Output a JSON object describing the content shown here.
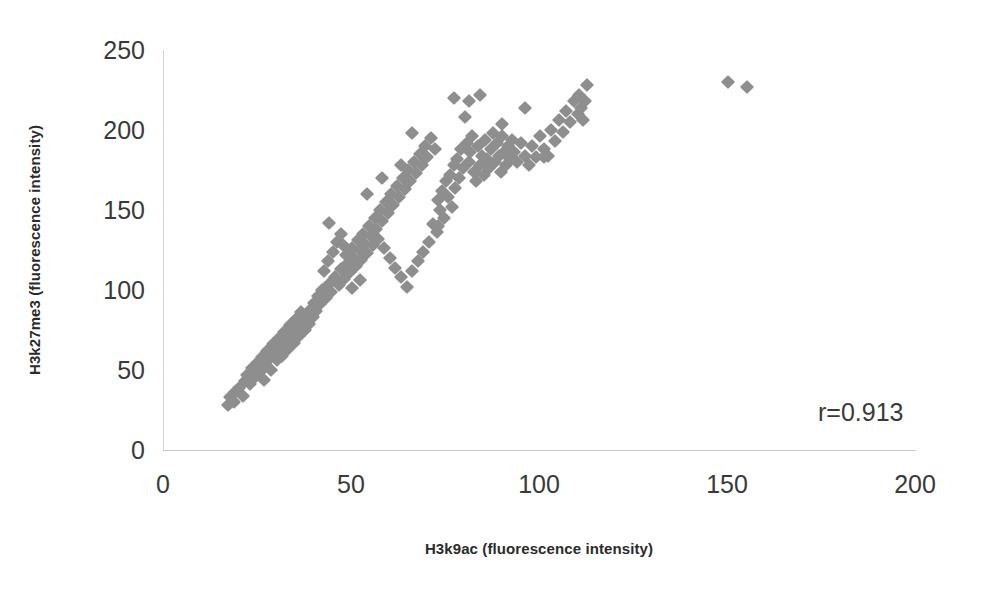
{
  "chart_data": {
    "type": "scatter",
    "title": "",
    "xlabel": "H3k9ac (fluorescence intensity)",
    "ylabel": "H3k27me3 (fluorescence intensity)",
    "xlim": [
      0,
      200
    ],
    "ylim": [
      0,
      250
    ],
    "xticks": [
      0,
      50,
      100,
      150,
      200
    ],
    "yticks": [
      0,
      50,
      100,
      150,
      200,
      250
    ],
    "grid": false,
    "legend": null,
    "marker": {
      "shape": "diamond",
      "color": "#8e8e8e",
      "size_px": 10
    },
    "annotations": [
      {
        "text": "r=0.913",
        "x": 172,
        "y": 32
      }
    ],
    "series": [
      {
        "name": "samples",
        "points": [
          [
            17,
            28
          ],
          [
            17.5,
            33
          ],
          [
            18.5,
            30
          ],
          [
            19,
            36
          ],
          [
            20,
            39
          ],
          [
            21,
            34
          ],
          [
            21.5,
            43
          ],
          [
            22,
            47
          ],
          [
            23,
            41
          ],
          [
            23.5,
            51
          ],
          [
            24,
            45
          ],
          [
            25,
            55
          ],
          [
            25.5,
            49
          ],
          [
            26,
            58
          ],
          [
            26.5,
            44
          ],
          [
            27,
            53
          ],
          [
            27.5,
            62
          ],
          [
            28,
            57
          ],
          [
            28.5,
            50
          ],
          [
            29,
            66
          ],
          [
            29.5,
            60
          ],
          [
            30,
            56
          ],
          [
            30.5,
            70
          ],
          [
            31,
            64
          ],
          [
            31.5,
            59
          ],
          [
            32,
            74
          ],
          [
            32.5,
            68
          ],
          [
            33,
            63
          ],
          [
            33.5,
            78
          ],
          [
            34,
            72
          ],
          [
            34.5,
            67
          ],
          [
            35,
            82
          ],
          [
            35.5,
            76
          ],
          [
            36,
            71
          ],
          [
            36.5,
            86
          ],
          [
            37,
            80
          ],
          [
            37.5,
            75
          ],
          [
            38,
            84
          ],
          [
            38.5,
            79
          ],
          [
            39,
            88
          ],
          [
            39.5,
            83
          ],
          [
            40,
            92
          ],
          [
            40.5,
            87
          ],
          [
            41,
            96
          ],
          [
            41.5,
            91
          ],
          [
            42,
            100
          ],
          [
            42.5,
            112
          ],
          [
            43,
            95
          ],
          [
            43.5,
            118
          ],
          [
            44,
            104
          ],
          [
            44.5,
            99
          ],
          [
            45,
            124
          ],
          [
            45.5,
            108
          ],
          [
            46,
            130
          ],
          [
            46.5,
            103
          ],
          [
            47,
            113
          ],
          [
            47.5,
            128
          ],
          [
            48,
            107
          ],
          [
            48.5,
            122
          ],
          [
            49,
            117
          ],
          [
            49.5,
            111
          ],
          [
            50,
            126
          ],
          [
            50.5,
            120
          ],
          [
            51,
            115
          ],
          [
            51.5,
            131
          ],
          [
            52,
            125
          ],
          [
            52.5,
            119
          ],
          [
            53,
            135
          ],
          [
            53.5,
            129
          ],
          [
            54,
            123
          ],
          [
            54.5,
            140
          ],
          [
            55,
            134
          ],
          [
            55.5,
            128
          ],
          [
            56,
            145
          ],
          [
            56.5,
            138
          ],
          [
            57,
            132
          ],
          [
            57.5,
            150
          ],
          [
            58,
            143
          ],
          [
            58.5,
            126
          ],
          [
            59,
            155
          ],
          [
            59.5,
            148
          ],
          [
            60,
            120
          ],
          [
            60.5,
            160
          ],
          [
            61,
            153
          ],
          [
            61.5,
            114
          ],
          [
            62,
            165
          ],
          [
            62.5,
            158
          ],
          [
            63,
            108
          ],
          [
            63.5,
            170
          ],
          [
            64,
            163
          ],
          [
            64.5,
            102
          ],
          [
            65,
            175
          ],
          [
            65.5,
            168
          ],
          [
            66,
            112
          ],
          [
            66.5,
            180
          ],
          [
            67,
            173
          ],
          [
            67.5,
            118
          ],
          [
            68,
            185
          ],
          [
            68.5,
            178
          ],
          [
            69,
            124
          ],
          [
            69.5,
            190
          ],
          [
            70,
            183
          ],
          [
            70.5,
            130
          ],
          [
            71,
            195
          ],
          [
            71.5,
            141
          ],
          [
            72,
            188
          ],
          [
            72.5,
            136
          ],
          [
            73,
            156
          ],
          [
            73.5,
            150
          ],
          [
            74,
            162
          ],
          [
            74.5,
            145
          ],
          [
            75,
            168
          ],
          [
            75.5,
            158
          ],
          [
            76,
            172
          ],
          [
            76.5,
            152
          ],
          [
            77,
            178
          ],
          [
            77.5,
            164
          ],
          [
            78,
            182
          ],
          [
            78.5,
            170
          ],
          [
            79,
            188
          ],
          [
            79.5,
            176
          ],
          [
            80,
            208
          ],
          [
            80.5,
            192
          ],
          [
            81,
            180
          ],
          [
            81.5,
            186
          ],
          [
            82,
            196
          ],
          [
            82.5,
            174
          ],
          [
            83,
            168
          ],
          [
            83.5,
            190
          ],
          [
            84,
            178
          ],
          [
            84.5,
            184
          ],
          [
            85,
            172
          ],
          [
            85.5,
            194
          ],
          [
            86,
            182
          ],
          [
            86.5,
            176
          ],
          [
            87,
            188
          ],
          [
            87.5,
            198
          ],
          [
            88,
            180
          ],
          [
            88.5,
            192
          ],
          [
            89,
            184
          ],
          [
            89.5,
            174
          ],
          [
            90,
            196
          ],
          [
            90.5,
            186
          ],
          [
            91,
            178
          ],
          [
            91.5,
            190
          ],
          [
            92,
            182
          ],
          [
            92.5,
            194
          ],
          [
            93,
            186
          ],
          [
            94,
            180
          ],
          [
            95,
            192
          ],
          [
            96,
            184
          ],
          [
            97,
            178
          ],
          [
            98,
            190
          ],
          [
            99,
            183
          ],
          [
            100,
            196
          ],
          [
            101,
            188
          ],
          [
            102,
            184
          ],
          [
            103,
            200
          ],
          [
            104,
            193
          ],
          [
            105,
            206
          ],
          [
            106,
            199
          ],
          [
            107,
            212
          ],
          [
            108,
            205
          ],
          [
            109,
            218
          ],
          [
            110,
            210
          ],
          [
            110.5,
            222
          ],
          [
            111,
            214
          ],
          [
            111.5,
            206
          ],
          [
            112,
            218
          ],
          [
            112.5,
            228
          ],
          [
            101,
            183
          ],
          [
            96,
            214
          ],
          [
            90,
            204
          ],
          [
            84,
            222
          ],
          [
            81,
            218
          ],
          [
            77,
            220
          ],
          [
            73,
            140
          ],
          [
            66,
            198
          ],
          [
            63,
            178
          ],
          [
            58,
            170
          ],
          [
            54,
            160
          ],
          [
            52,
            106
          ],
          [
            50,
            101
          ],
          [
            47,
            135
          ],
          [
            44,
            142
          ],
          [
            150,
            230
          ],
          [
            155,
            227
          ]
        ]
      }
    ]
  },
  "axes": {
    "y_ticks": [
      "250",
      "200",
      "150",
      "100",
      "50",
      "0"
    ],
    "x_ticks": [
      "0",
      "50",
      "100",
      "150",
      "200"
    ]
  },
  "labels": {
    "y_axis_title": "H3k27me3 (fluorescence intensity)",
    "x_axis_title": "H3k9ac (fluorescence intensity)",
    "correlation": "r=0.913"
  }
}
